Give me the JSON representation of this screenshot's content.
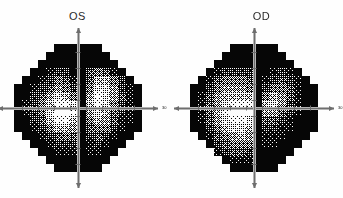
{
  "figure": {
    "background_color": "#fefefe",
    "type": "visual-field-grayscale-pair"
  },
  "panels": [
    {
      "id": "os",
      "title": "OS",
      "x_axis_label": "30",
      "y_axis_label": "",
      "center": {
        "x": 78,
        "y": 86
      },
      "radius": 64
    },
    {
      "id": "od",
      "title": "OD",
      "x_axis_label": "30",
      "y_axis_label": "",
      "center": {
        "x": 82,
        "y": 86
      },
      "radius": 64
    }
  ],
  "colors": {
    "ink": "#0b0b0b",
    "paper": "#fefefe",
    "axis": "#b4b4b4",
    "axis_dark": "#6e6e6e",
    "title_color": "#2b2b2b"
  },
  "chart_data": {
    "type": "heatmap",
    "title": "",
    "subtitle": "",
    "xlabel": "",
    "ylabel": "",
    "legend_position": "none",
    "grid": false,
    "colormap": "grayscale-halftone",
    "value_range": [
      0,
      9
    ],
    "value_meaning": "0 = darkest (deepest defect / lowest sensitivity), 9 = brightest (normal sensitivity)",
    "cell_size_px": 8,
    "grid_cols": 16,
    "grid_rows": 16,
    "axis_extent_deg": 30,
    "series": [
      {
        "name": "OS",
        "label": "OS",
        "cx": 7.5,
        "cy": 7.5,
        "radius_cells": 8.0,
        "matrix": [
          [
            0,
            0,
            0,
            0,
            0,
            0,
            0,
            0,
            0,
            0,
            0,
            0,
            0,
            0,
            0,
            0
          ],
          [
            0,
            0,
            0,
            0,
            0,
            0,
            0,
            0,
            0,
            0,
            0,
            0,
            0,
            0,
            0,
            0
          ],
          [
            0,
            0,
            0,
            0,
            0,
            0,
            0,
            0,
            0,
            0,
            0,
            0,
            0,
            0,
            0,
            0
          ],
          [
            0,
            0,
            0,
            0,
            1,
            2,
            2,
            0,
            0,
            3,
            4,
            3,
            1,
            0,
            0,
            0
          ],
          [
            0,
            0,
            0,
            1,
            2,
            4,
            3,
            1,
            0,
            3,
            6,
            6,
            4,
            2,
            0,
            0
          ],
          [
            0,
            0,
            1,
            2,
            3,
            5,
            4,
            2,
            0,
            4,
            7,
            7,
            5,
            2,
            1,
            0
          ],
          [
            0,
            0,
            2,
            3,
            5,
            7,
            6,
            4,
            0,
            5,
            8,
            7,
            5,
            3,
            1,
            0
          ],
          [
            0,
            1,
            2,
            4,
            6,
            8,
            8,
            7,
            0,
            6,
            8,
            7,
            4,
            2,
            1,
            0
          ],
          [
            0,
            1,
            2,
            4,
            7,
            9,
            9,
            8,
            0,
            5,
            7,
            6,
            3,
            2,
            1,
            0
          ],
          [
            0,
            0,
            2,
            3,
            6,
            8,
            8,
            6,
            0,
            4,
            6,
            5,
            3,
            1,
            1,
            0
          ],
          [
            0,
            0,
            1,
            2,
            4,
            6,
            6,
            5,
            0,
            3,
            4,
            4,
            2,
            1,
            0,
            0
          ],
          [
            0,
            0,
            0,
            1,
            2,
            3,
            4,
            3,
            0,
            2,
            3,
            2,
            1,
            0,
            0,
            0
          ],
          [
            0,
            0,
            0,
            0,
            1,
            2,
            2,
            2,
            0,
            1,
            2,
            1,
            0,
            0,
            0,
            0
          ],
          [
            0,
            0,
            0,
            0,
            0,
            1,
            1,
            1,
            0,
            1,
            1,
            0,
            0,
            0,
            0,
            0
          ],
          [
            0,
            0,
            0,
            0,
            0,
            0,
            0,
            0,
            0,
            0,
            0,
            0,
            0,
            0,
            0,
            0
          ],
          [
            0,
            0,
            0,
            0,
            0,
            0,
            0,
            0,
            0,
            0,
            0,
            0,
            0,
            0,
            0,
            0
          ]
        ]
      },
      {
        "name": "OD",
        "label": "OD",
        "cx": 7.5,
        "cy": 7.5,
        "radius_cells": 8.0,
        "matrix": [
          [
            0,
            0,
            0,
            0,
            0,
            0,
            0,
            0,
            0,
            0,
            0,
            0,
            0,
            0,
            0,
            0
          ],
          [
            0,
            0,
            0,
            0,
            0,
            0,
            0,
            0,
            0,
            0,
            0,
            0,
            0,
            0,
            0,
            0
          ],
          [
            0,
            0,
            0,
            0,
            0,
            0,
            0,
            0,
            0,
            0,
            0,
            0,
            0,
            0,
            0,
            0
          ],
          [
            0,
            0,
            0,
            1,
            2,
            2,
            2,
            2,
            0,
            0,
            1,
            2,
            1,
            0,
            0,
            0
          ],
          [
            0,
            0,
            1,
            3,
            4,
            4,
            4,
            3,
            0,
            1,
            2,
            3,
            2,
            1,
            0,
            0
          ],
          [
            0,
            0,
            2,
            4,
            5,
            5,
            5,
            4,
            0,
            2,
            4,
            4,
            3,
            1,
            0,
            0
          ],
          [
            0,
            1,
            3,
            5,
            6,
            6,
            6,
            6,
            0,
            4,
            6,
            5,
            3,
            1,
            0,
            0
          ],
          [
            0,
            1,
            3,
            5,
            7,
            8,
            8,
            8,
            0,
            6,
            7,
            5,
            2,
            1,
            0,
            0
          ],
          [
            0,
            1,
            3,
            6,
            8,
            9,
            9,
            9,
            0,
            5,
            5,
            3,
            2,
            1,
            0,
            0
          ],
          [
            0,
            1,
            3,
            5,
            7,
            8,
            8,
            7,
            0,
            3,
            3,
            2,
            1,
            0,
            0,
            0
          ],
          [
            0,
            0,
            2,
            4,
            6,
            7,
            7,
            6,
            0,
            2,
            2,
            1,
            1,
            0,
            0,
            0
          ],
          [
            0,
            0,
            1,
            3,
            4,
            5,
            6,
            5,
            0,
            1,
            1,
            1,
            0,
            0,
            0,
            0
          ],
          [
            0,
            0,
            0,
            2,
            3,
            4,
            4,
            4,
            0,
            1,
            1,
            0,
            0,
            0,
            0,
            0
          ],
          [
            0,
            0,
            0,
            1,
            2,
            3,
            3,
            2,
            0,
            0,
            0,
            0,
            0,
            0,
            0,
            0
          ],
          [
            0,
            0,
            0,
            0,
            0,
            1,
            1,
            1,
            0,
            0,
            0,
            0,
            0,
            0,
            0,
            0
          ],
          [
            0,
            0,
            0,
            0,
            0,
            0,
            0,
            0,
            0,
            0,
            0,
            0,
            0,
            0,
            0,
            0
          ]
        ]
      }
    ]
  }
}
